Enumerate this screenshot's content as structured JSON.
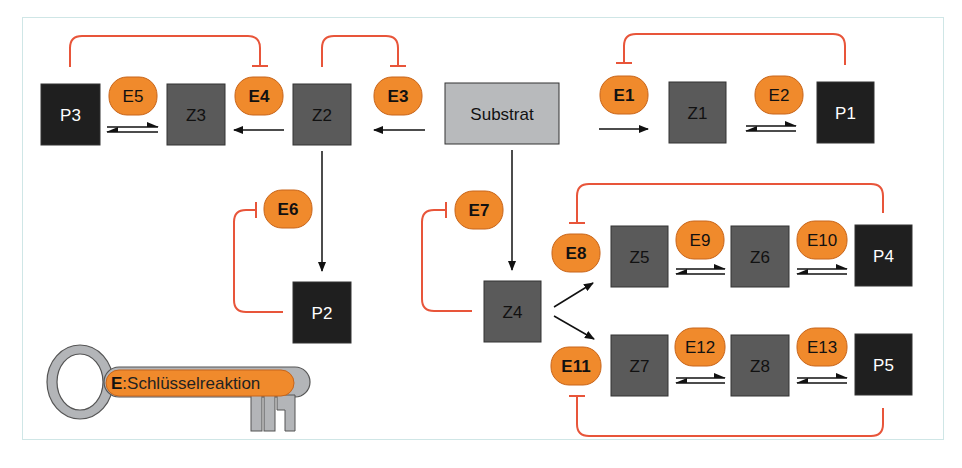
{
  "colors": {
    "product": "#1f1f1f",
    "intermediate": "#5a5a5a",
    "substrate": "#b8babc",
    "enzyme": "#f08a2c",
    "enzyme_border": "#c8651a",
    "inhibition": "#e8553a",
    "arrow": "#111111",
    "frame": "#cfe6e6",
    "key_metal": "#b3b5b8"
  },
  "nodes": [
    {
      "id": "P3",
      "label": "P3",
      "kind": "product",
      "x": 41,
      "y": 84,
      "w": 59,
      "h": 61
    },
    {
      "id": "Z3",
      "label": "Z3",
      "kind": "intermediate",
      "x": 167,
      "y": 84,
      "w": 58,
      "h": 61
    },
    {
      "id": "Z2",
      "label": "Z2",
      "kind": "intermediate",
      "x": 293,
      "y": 84,
      "w": 58,
      "h": 61
    },
    {
      "id": "Substrat",
      "label": "Substrat",
      "kind": "substrate",
      "x": 445,
      "y": 83,
      "w": 114,
      "h": 61
    },
    {
      "id": "Z1",
      "label": "Z1",
      "kind": "intermediate",
      "x": 669,
      "y": 82,
      "w": 57,
      "h": 61
    },
    {
      "id": "P1",
      "label": "P1",
      "kind": "product",
      "x": 817,
      "y": 82,
      "w": 57,
      "h": 61
    },
    {
      "id": "P2",
      "label": "P2",
      "kind": "product",
      "x": 293,
      "y": 282,
      "w": 58,
      "h": 61
    },
    {
      "id": "Z4",
      "label": "Z4",
      "kind": "intermediate",
      "x": 484,
      "y": 281,
      "w": 57,
      "h": 61
    },
    {
      "id": "Z5",
      "label": "Z5",
      "kind": "intermediate",
      "x": 611,
      "y": 226,
      "w": 57,
      "h": 61
    },
    {
      "id": "Z6",
      "label": "Z6",
      "kind": "intermediate",
      "x": 731,
      "y": 226,
      "w": 58,
      "h": 61
    },
    {
      "id": "P4",
      "label": "P4",
      "kind": "product",
      "x": 855,
      "y": 225,
      "w": 57,
      "h": 61
    },
    {
      "id": "Z7",
      "label": "Z7",
      "kind": "intermediate",
      "x": 611,
      "y": 335,
      "w": 57,
      "h": 61
    },
    {
      "id": "Z8",
      "label": "Z8",
      "kind": "intermediate",
      "x": 731,
      "y": 335,
      "w": 58,
      "h": 61
    },
    {
      "id": "P5",
      "label": "P5",
      "kind": "product",
      "x": 855,
      "y": 334,
      "w": 57,
      "h": 61
    }
  ],
  "enzymes": [
    {
      "id": "E1",
      "label": "E1",
      "bold": true,
      "cx": 624,
      "cy": 95
    },
    {
      "id": "E2",
      "label": "E2",
      "bold": false,
      "cx": 779,
      "cy": 95
    },
    {
      "id": "E3",
      "label": "E3",
      "bold": true,
      "cx": 398,
      "cy": 96
    },
    {
      "id": "E4",
      "label": "E4",
      "bold": true,
      "cx": 259,
      "cy": 96
    },
    {
      "id": "E5",
      "label": "E5",
      "bold": false,
      "cx": 133,
      "cy": 96
    },
    {
      "id": "E6",
      "label": "E6",
      "bold": true,
      "cx": 288,
      "cy": 209
    },
    {
      "id": "E7",
      "label": "E7",
      "bold": true,
      "cx": 479,
      "cy": 210
    },
    {
      "id": "E8",
      "label": "E8",
      "bold": true,
      "cx": 576,
      "cy": 253
    },
    {
      "id": "E9",
      "label": "E9",
      "bold": false,
      "cx": 700,
      "cy": 240
    },
    {
      "id": "E10",
      "label": "E10",
      "bold": false,
      "cx": 822,
      "cy": 240
    },
    {
      "id": "E11",
      "label": "E11",
      "bold": true,
      "cx": 576,
      "cy": 366
    },
    {
      "id": "E12",
      "label": "E12",
      "bold": false,
      "cx": 700,
      "cy": 347
    },
    {
      "id": "E13",
      "label": "E13",
      "bold": false,
      "cx": 822,
      "cy": 347
    }
  ],
  "key_legend": {
    "prefix": "E",
    "text": ":Schlüsselreaktion"
  }
}
